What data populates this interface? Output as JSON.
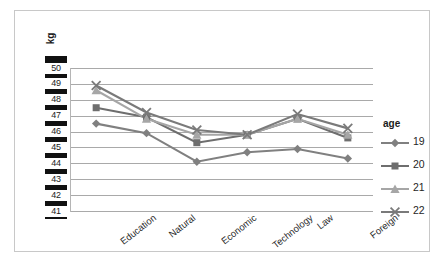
{
  "axis_title": "kg",
  "legend": {
    "title": "age",
    "entries": [
      {
        "label": "19",
        "marker": "diamond",
        "color": "#808080"
      },
      {
        "label": "20",
        "marker": "square",
        "color": "#6e6e6e"
      },
      {
        "label": "21",
        "marker": "triangle",
        "color": "#a6a6a6"
      },
      {
        "label": "22",
        "marker": "cross",
        "color": "#7a7a7a"
      }
    ]
  },
  "y_ticks": [
    "50",
    "49",
    "48",
    "47",
    "46",
    "45",
    "44",
    "43",
    "42",
    "41"
  ],
  "chart_data": {
    "type": "line",
    "title": "",
    "xlabel": "",
    "ylabel": "kg",
    "ylim": [
      41,
      50
    ],
    "grid": true,
    "legend_position": "right",
    "legend_title": "age",
    "categories": [
      "Education",
      "Natural",
      "Economic",
      "Technology",
      "Law",
      "Foreign"
    ],
    "series": [
      {
        "name": "19",
        "marker": "diamond",
        "color": "#808080",
        "values": [
          46.5,
          45.9,
          44.1,
          44.7,
          44.9,
          44.3
        ]
      },
      {
        "name": "20",
        "marker": "square",
        "color": "#6e6e6e",
        "values": [
          47.5,
          46.9,
          45.3,
          45.8,
          46.8,
          45.6
        ]
      },
      {
        "name": "21",
        "marker": "triangle",
        "color": "#a6a6a6",
        "values": [
          48.6,
          46.8,
          45.8,
          45.8,
          46.8,
          45.8
        ]
      },
      {
        "name": "22",
        "marker": "cross",
        "color": "#7a7a7a",
        "values": [
          48.9,
          47.2,
          46.1,
          45.8,
          47.1,
          46.2
        ]
      }
    ]
  }
}
